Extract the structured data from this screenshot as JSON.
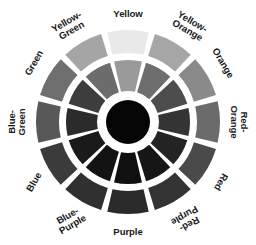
{
  "figure": {
    "background_color": "#ffffff",
    "gap_color": "#ffffff",
    "label_color": "#1a1a1a",
    "center_disc_color": "#050505"
  },
  "wheel": {
    "center_x": 128,
    "center_y": 122,
    "hub_radius": 22,
    "inner_ring_inner_radius": 31,
    "inner_ring_outer_radius": 62,
    "outer_ring_inner_radius": 69,
    "outer_ring_outer_radius": 92,
    "segment_count": 12,
    "gap_degrees": 4
  },
  "segments": [
    {
      "name": "Yellow",
      "label": "Yellow",
      "angle_deg": 0,
      "label_rotation_deg": 0,
      "label_x": 128,
      "label_y": 14,
      "outer_color": "#e9e9e9",
      "inner_color": "#9a9a9a"
    },
    {
      "name": "Yellow-Orange",
      "label": "Yellow-\nOrange",
      "angle_deg": 30,
      "label_rotation_deg": 30,
      "label_x": 190,
      "label_y": 26,
      "outer_color": "#a6a6a6",
      "inner_color": "#6e6e6e"
    },
    {
      "name": "Orange",
      "label": "Orange",
      "angle_deg": 60,
      "label_rotation_deg": 60,
      "label_x": 223,
      "label_y": 63,
      "outer_color": "#8a8a8a",
      "inner_color": "#4d4d4d"
    },
    {
      "name": "Red-Orange",
      "label": "Red-\nOrange",
      "angle_deg": 90,
      "label_rotation_deg": 90,
      "label_x": 239,
      "label_y": 122,
      "outer_color": "#6b6b6b",
      "inner_color": "#343434"
    },
    {
      "name": "Red",
      "label": "Red",
      "angle_deg": 120,
      "label_rotation_deg": 120,
      "label_x": 221,
      "label_y": 182,
      "outer_color": "#4a4a4a",
      "inner_color": "#232323"
    },
    {
      "name": "Red-Purple",
      "label": "Red-\nPurple",
      "angle_deg": 150,
      "label_rotation_deg": 150,
      "label_x": 187,
      "label_y": 220,
      "outer_color": "#333333",
      "inner_color": "#161616"
    },
    {
      "name": "Purple",
      "label": "Purple",
      "angle_deg": 180,
      "label_rotation_deg": 0,
      "label_x": 128,
      "label_y": 232,
      "outer_color": "#2a2a2a",
      "inner_color": "#101010"
    },
    {
      "name": "Blue-Purple",
      "label": "Blue-\nPurple",
      "angle_deg": 210,
      "label_rotation_deg": -30,
      "label_x": 70,
      "label_y": 220,
      "outer_color": "#303030",
      "inner_color": "#131313"
    },
    {
      "name": "Blue",
      "label": "Blue",
      "angle_deg": 240,
      "label_rotation_deg": -60,
      "label_x": 34,
      "label_y": 182,
      "outer_color": "#3b3b3b",
      "inner_color": "#1a1a1a"
    },
    {
      "name": "Blue-Green",
      "label": "Blue-\nGreen",
      "angle_deg": 270,
      "label_rotation_deg": -90,
      "label_x": 17,
      "label_y": 122,
      "outer_color": "#585858",
      "inner_color": "#2b2b2b"
    },
    {
      "name": "Green",
      "label": "Green",
      "angle_deg": 300,
      "label_rotation_deg": -60,
      "label_x": 34,
      "label_y": 63,
      "outer_color": "#6f6f6f",
      "inner_color": "#3d3d3d"
    },
    {
      "name": "Yellow-Green",
      "label": "Yellow-\nGreen",
      "angle_deg": 330,
      "label_rotation_deg": -30,
      "label_x": 69,
      "label_y": 26,
      "outer_color": "#a5a5a5",
      "inner_color": "#6c6c6c"
    }
  ]
}
